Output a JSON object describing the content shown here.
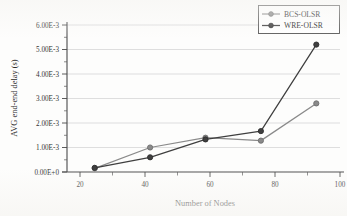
{
  "chart_data": {
    "type": "line",
    "title": "",
    "xlabel": "Number of Nodes",
    "ylabel": "AVG end-end delay (s)",
    "categories": [
      20,
      40,
      60,
      80,
      100
    ],
    "x": [
      20,
      40,
      60,
      80,
      100
    ],
    "xlim": [
      10,
      110
    ],
    "ylim": [
      0,
      0.006
    ],
    "grid": "horizontal",
    "legend_position": "top-right",
    "xtick_labels": [
      "20",
      "40",
      "60",
      "80",
      "100"
    ],
    "ytick_labels": [
      "0.00E+0",
      "1.00E-3",
      "2.00E-3",
      "3.00E-3",
      "4.00E-3",
      "5.00E-3",
      "6.00E-3"
    ],
    "ytick_values": [
      0,
      0.001,
      0.002,
      0.003,
      0.004,
      0.005,
      0.006
    ],
    "series": [
      {
        "name": "BCS-OLSR",
        "color": "#8a8a8a",
        "marker": "circle",
        "values": [
          0.00015,
          0.001,
          0.0014,
          0.00128,
          0.0028
        ]
      },
      {
        "name": "WRE-OLSR",
        "color": "#3f3f3f",
        "marker": "circle",
        "values": [
          0.00017,
          0.0006,
          0.00133,
          0.00167,
          0.0052
        ]
      }
    ]
  },
  "legend": {
    "entries": [
      {
        "label": "BCS-OLSR"
      },
      {
        "label": "WRE-OLSR"
      }
    ]
  },
  "axes": {
    "x_title": "Number of Nodes",
    "y_title": "AVG end-end delay (s)"
  }
}
